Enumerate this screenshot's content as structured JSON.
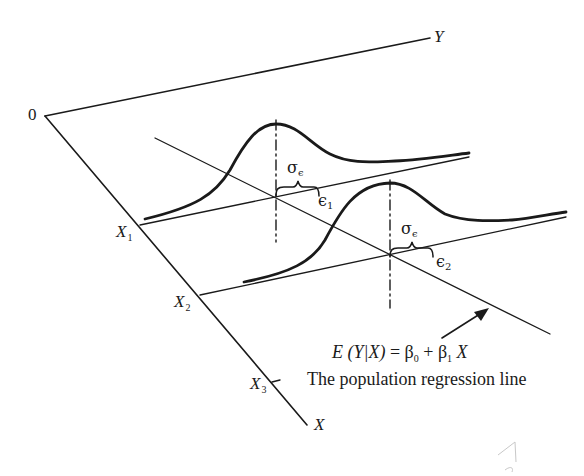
{
  "diagram": {
    "type": "population-regression-3d",
    "axes": {
      "origin_label": "0",
      "y_label": "Y",
      "x_label": "X",
      "x_ticks": [
        {
          "name": "X",
          "sub": "1"
        },
        {
          "name": "X",
          "sub": "2"
        },
        {
          "name": "X",
          "sub": "3"
        }
      ]
    },
    "distributions": [
      {
        "sigma_label": "σ",
        "sigma_sub": "ϵ",
        "error_label": "ϵ",
        "error_sub": "1"
      },
      {
        "sigma_label": "σ",
        "sigma_sub": "ϵ",
        "error_label": "ϵ",
        "error_sub": "2"
      }
    ],
    "formula": {
      "lhs_E": "E",
      "lhs_args": "(Y|X)",
      "equals": "=",
      "beta": "β",
      "beta0_sub": "0",
      "plus": "+",
      "beta1_sub": "1",
      "var": "X"
    },
    "caption": "The population regression line"
  }
}
